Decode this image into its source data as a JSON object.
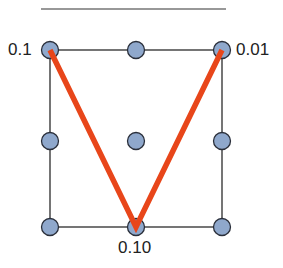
{
  "diagram": {
    "colors": {
      "node_fill": "#8fa8cc",
      "node_stroke": "#2a2f3a",
      "grid_line": "#1a1a1a",
      "path_line": "#e8461a",
      "top_rule": "#333333"
    },
    "labels": {
      "top_left": "0.1",
      "top_right": "0.01",
      "bottom_middle": "0.10"
    },
    "grid": {
      "rows": 3,
      "cols": 3
    },
    "path": [
      "top_left",
      "bottom_middle",
      "top_right"
    ]
  }
}
